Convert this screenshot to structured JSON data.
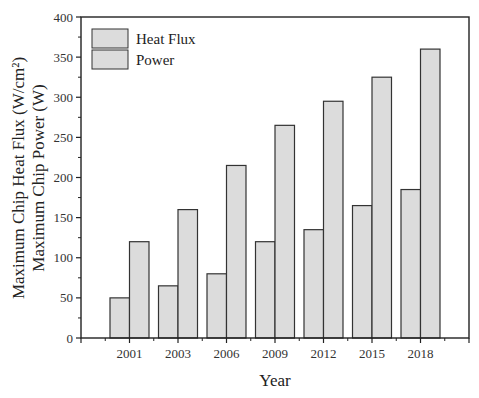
{
  "chart_data": {
    "type": "bar",
    "title": "",
    "xlabel": "Year",
    "ylabel_lines": [
      "Maximum Chip Heat Flux (W/cm²)",
      "Maximum Chip Power (W)"
    ],
    "categories": [
      "2001",
      "2003",
      "2006",
      "2009",
      "2012",
      "2015",
      "2018"
    ],
    "series": [
      {
        "name": "Heat Flux",
        "values": [
          50,
          65,
          80,
          120,
          135,
          165,
          185
        ],
        "color": "#dddddd"
      },
      {
        "name": "Power",
        "values": [
          120,
          160,
          215,
          265,
          295,
          325,
          360
        ],
        "color": "#dddddd"
      }
    ],
    "ylim": [
      0,
      400
    ],
    "yticks": [
      0,
      50,
      100,
      150,
      200,
      250,
      300,
      350,
      400
    ],
    "grid": false,
    "legend_position": "top-left"
  },
  "colors": {
    "bar_fill": "#dcdcdc",
    "bar_stroke": "#333333",
    "axis": "#222222"
  }
}
